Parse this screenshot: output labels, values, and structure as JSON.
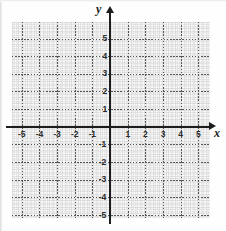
{
  "figure": {
    "kind": "cartesian-coordinate-grid",
    "axis_labels": {
      "x": "x",
      "y": "y"
    },
    "background_color": "#ffffff",
    "axis_color": "#1c1c1c",
    "grid_color": "#555555"
  },
  "chart_data": {
    "type": "scatter",
    "title": "",
    "xlabel": "x",
    "ylabel": "y",
    "xlim": [
      -5.6,
      5.7
    ],
    "ylim": [
      -5.7,
      5.6
    ],
    "grid": true,
    "minor_grid": true,
    "minor_ticks_per_unit": 4,
    "legend": "none",
    "x_ticks": [
      -5,
      -4,
      -3,
      -2,
      -1,
      1,
      2,
      3,
      4,
      5
    ],
    "y_ticks": [
      -5,
      -4,
      -3,
      -2,
      -1,
      1,
      2,
      3,
      4,
      5
    ],
    "x_tick_labels": [
      "-5",
      "-4",
      "-3",
      "-2",
      "-1",
      "1",
      "2",
      "3",
      "4",
      "5"
    ],
    "y_tick_labels": [
      "-5",
      "-4",
      "-3",
      "-2",
      "-1",
      "1",
      "2",
      "3",
      "4",
      "5"
    ],
    "series": [],
    "values": [],
    "categories": []
  },
  "ticks": {
    "x_negative": [
      "-5",
      "-4",
      "-3",
      "-2",
      "-1"
    ],
    "x_positive": [
      "1",
      "2",
      "3",
      "4",
      "5"
    ],
    "y_positive": [
      "5",
      "4",
      "3",
      "2",
      "1"
    ],
    "y_negative": [
      "-1",
      "-2",
      "-3",
      "-4",
      "-5"
    ]
  }
}
